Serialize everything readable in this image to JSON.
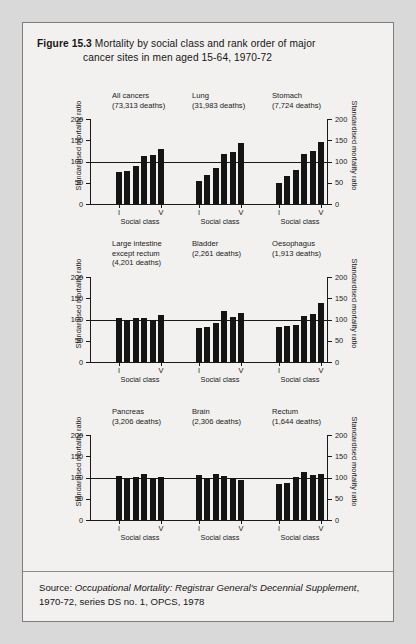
{
  "figure": {
    "label": "Figure 15.3",
    "title_line1": "Mortality by social class and rank order of major",
    "title_line2": "cancer sites in men aged 15-64, 1970-72"
  },
  "source": {
    "prefix": "Source: ",
    "italic_part": "Occupational Mortality: Registrar General's Decennial Supplement",
    "rest": ", 1970-72, series DS no. 1, OPCS, 1978"
  },
  "axis": {
    "y_label": "Standardised mortality ratio",
    "y_ticks": [
      "0",
      "50",
      "100",
      "150",
      "200"
    ],
    "y_min": 0,
    "y_max": 200,
    "x_label": "Social class",
    "x_first": "I",
    "x_last": "V",
    "reference_line": 100
  },
  "colors": {
    "page_background": "#d9d9d9",
    "card_background": "#f2f1ef",
    "card_border": "#7d7d7d",
    "bar": "#141414",
    "axis": "#1a1a1a",
    "text": "#161616"
  },
  "chart_data": {
    "type": "bar",
    "title": "Mortality by social class and rank order of major cancer sites in men aged 15-64, 1970-72",
    "xlabel": "Social class",
    "ylabel": "Standardised mortality ratio",
    "ylim": [
      0,
      200
    ],
    "yticks": [
      0,
      50,
      100,
      150,
      200
    ],
    "grid": false,
    "legend": "none",
    "reference_line": 100,
    "categories": [
      "I",
      "II",
      "IIIN",
      "IIIM",
      "IV",
      "V"
    ],
    "panels": [
      {
        "name": "All cancers",
        "deaths": "(73,313 deaths)",
        "row": 1,
        "col": 1,
        "values": [
          75,
          78,
          90,
          112,
          115,
          130
        ]
      },
      {
        "name": "Lung",
        "deaths": "(31,983 deaths)",
        "row": 1,
        "col": 2,
        "values": [
          53,
          68,
          84,
          118,
          122,
          143
        ]
      },
      {
        "name": "Stomach",
        "deaths": "(7,724 deaths)",
        "row": 1,
        "col": 3,
        "values": [
          50,
          65,
          80,
          118,
          124,
          147
        ]
      },
      {
        "name": "Large intestine except rectum",
        "deaths": "(4,201 deaths)",
        "row": 2,
        "col": 1,
        "values": [
          104,
          100,
          103,
          103,
          100,
          110
        ]
      },
      {
        "name": "Bladder",
        "deaths": "(2,261 deaths)",
        "row": 2,
        "col": 2,
        "values": [
          80,
          83,
          91,
          120,
          107,
          116
        ]
      },
      {
        "name": "Oesophagus",
        "deaths": "(1,913 deaths)",
        "row": 2,
        "col": 3,
        "values": [
          83,
          85,
          86,
          108,
          113,
          140
        ]
      },
      {
        "name": "Pancreas",
        "deaths": "(3,206 deaths)",
        "row": 3,
        "col": 1,
        "values": [
          103,
          100,
          102,
          108,
          99,
          102
        ]
      },
      {
        "name": "Brain",
        "deaths": "(2,306 deaths)",
        "row": 3,
        "col": 2,
        "values": [
          106,
          100,
          109,
          104,
          98,
          93
        ]
      },
      {
        "name": "Rectum",
        "deaths": "(1,644 deaths)",
        "row": 3,
        "col": 3,
        "values": [
          85,
          88,
          102,
          113,
          105,
          108
        ]
      }
    ]
  }
}
